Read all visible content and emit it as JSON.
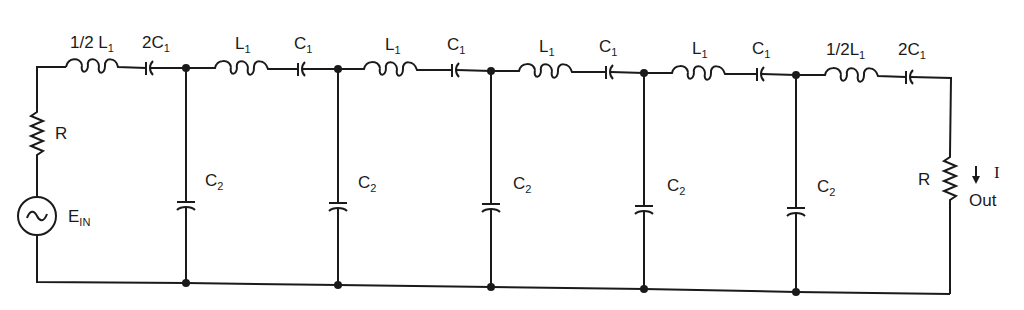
{
  "diagram": {
    "title": "",
    "type": "LC band-pass ladder filter schematic",
    "source": {
      "name": "E",
      "subscript": "IN",
      "symbol": "~"
    },
    "source_resistor": {
      "label": "R"
    },
    "load_resistor": {
      "label": "R"
    },
    "output": {
      "current_label": "I",
      "arrow": "down-arrow",
      "out_label": "Out"
    },
    "series_branches": [
      {
        "inductor": {
          "prefix": "1/2 L",
          "sub": "1"
        },
        "capacitor": {
          "prefix": "2C",
          "sub": "1"
        }
      },
      {
        "inductor": {
          "prefix": "L",
          "sub": "1"
        },
        "capacitor": {
          "prefix": "C",
          "sub": "1"
        }
      },
      {
        "inductor": {
          "prefix": "L",
          "sub": "1"
        },
        "capacitor": {
          "prefix": "C",
          "sub": "1"
        }
      },
      {
        "inductor": {
          "prefix": "L",
          "sub": "1"
        },
        "capacitor": {
          "prefix": "C",
          "sub": "1"
        }
      },
      {
        "inductor": {
          "prefix": "L",
          "sub": "1"
        },
        "capacitor": {
          "prefix": "C",
          "sub": "1"
        }
      },
      {
        "inductor": {
          "prefix": "1/2L",
          "sub": "1"
        },
        "capacitor": {
          "prefix": "2C",
          "sub": "1"
        }
      }
    ],
    "shunt_branches": [
      {
        "prefix": "C",
        "sub": "2"
      },
      {
        "prefix": "C",
        "sub": "2"
      },
      {
        "prefix": "C",
        "sub": "2"
      },
      {
        "prefix": "C",
        "sub": "2"
      },
      {
        "prefix": "C",
        "sub": "2"
      }
    ],
    "colors": {
      "ink": "#1a1a1a",
      "background": "#ffffff"
    }
  }
}
